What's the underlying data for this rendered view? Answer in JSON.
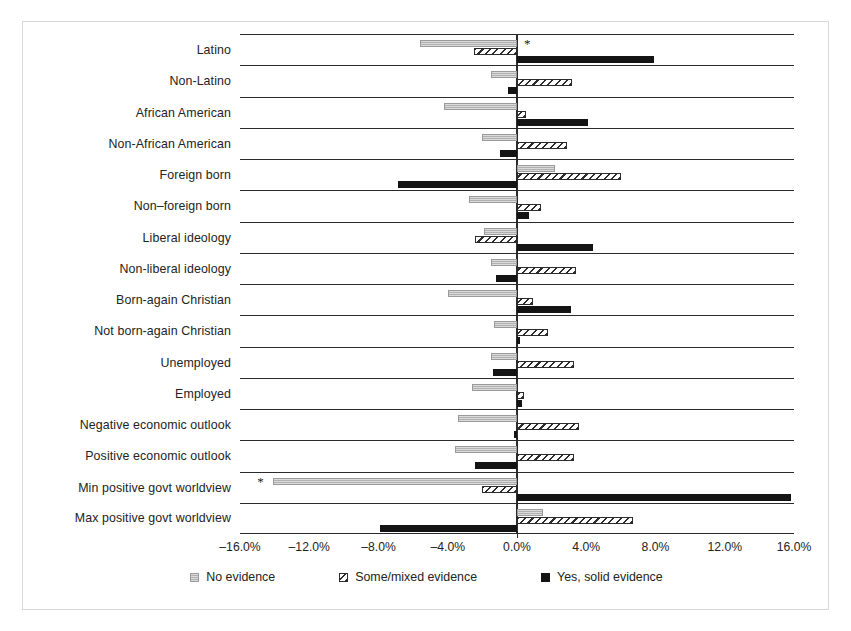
{
  "chart_data": {
    "type": "bar",
    "orientation": "horizontal",
    "title": "",
    "xlabel": "",
    "ylabel": "",
    "xlim": [
      -16.0,
      16.0
    ],
    "xticks": [
      -16.0,
      -12.0,
      -8.0,
      -4.0,
      0.0,
      4.0,
      8.0,
      12.0,
      16.0
    ],
    "xtick_labels": [
      "–16.0%",
      "–12.0%",
      "–8.0%",
      "–4.0%",
      "0.0%",
      "4.0%",
      "8.0%",
      "12.0%",
      "16.0%"
    ],
    "grid": false,
    "legend_position": "bottom",
    "categories": [
      "Latino",
      "Non-Latino",
      "African American",
      "Non-African American",
      "Foreign born",
      "Non–foreign born",
      "Liberal ideology",
      "Non-liberal ideology",
      "Born-again Christian",
      "Not born-again Christian",
      "Unemployed",
      "Employed",
      "Negative economic outlook",
      "Positive economic outlook",
      "Min positive govt worldview",
      "Max positive govt worldview"
    ],
    "series": [
      {
        "name": "No evidence",
        "key": "none",
        "color": "#b0b0b0",
        "pattern": "dotted-gray",
        "values": [
          -5.6,
          -1.5,
          -4.2,
          -2.0,
          2.2,
          -2.8,
          -1.9,
          -1.5,
          -4.0,
          -1.3,
          -1.5,
          -2.6,
          -3.4,
          -3.6,
          -14.1,
          1.5
        ]
      },
      {
        "name": "Some/mixed evidence",
        "key": "some",
        "color": "#ffffff",
        "pattern": "diagonal-hatch",
        "values": [
          -2.5,
          3.2,
          0.5,
          2.9,
          6.0,
          1.4,
          -2.4,
          3.4,
          0.9,
          1.8,
          3.3,
          0.4,
          3.6,
          3.3,
          -2.0,
          6.7
        ]
      },
      {
        "name": "Yes, solid evidence",
        "key": "yes",
        "color": "#141414",
        "pattern": "solid-black",
        "values": [
          7.9,
          -0.5,
          4.1,
          -1.0,
          -6.9,
          0.7,
          4.4,
          -1.2,
          3.1,
          0.2,
          -1.4,
          0.3,
          -0.2,
          -2.4,
          15.8,
          -7.9
        ]
      }
    ],
    "significance_markers": [
      {
        "category": "Latino",
        "series": "No evidence",
        "symbol": "*",
        "value_pct": 0.4
      },
      {
        "category": "Min positive govt worldview",
        "series": "No evidence",
        "symbol": "*",
        "value_pct": -15.0
      }
    ]
  },
  "legend": {
    "items": [
      {
        "label": "No evidence",
        "swatch": "dotted-gray-swatch"
      },
      {
        "label": "Some/mixed evidence",
        "swatch": "hatched-swatch"
      },
      {
        "label": "Yes, solid evidence",
        "swatch": "solid-black-swatch"
      }
    ]
  }
}
